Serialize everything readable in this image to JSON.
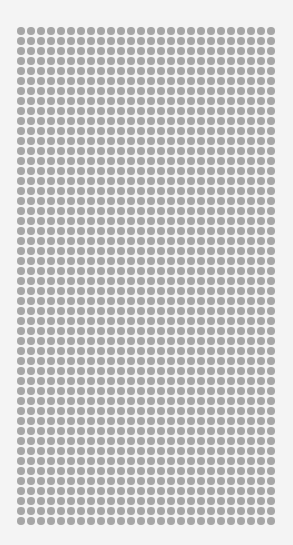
{
  "pattern": {
    "type": "dot-grid",
    "columns": 26,
    "rows": 50,
    "dot_color": "#a6a6a6",
    "background_color": "#f4f4f4",
    "spacing_px": 10,
    "dot_diameter_px": 7.5
  }
}
